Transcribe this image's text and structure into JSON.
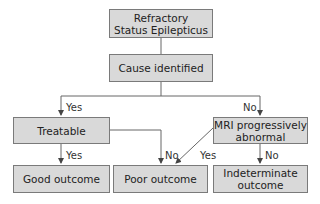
{
  "nodes": {
    "rse": "Refractory\nStatus Epilepticus",
    "cause": "Cause identified",
    "treatable": "Treatable",
    "mri": "MRI progressively\nabnormal",
    "good": "Good outcome",
    "poor": "Poor outcome",
    "indeterminate": "Indeterminate\noutcome"
  },
  "edges": {
    "cause_yes": "Yes",
    "cause_no": "No",
    "treatable_yes": "Yes",
    "treatable_no": "No",
    "mri_yes": "Yes",
    "mri_no": "No"
  },
  "colors": {
    "box_fill": "#d9d9d9",
    "box_border": "#7a7a7a",
    "line": "#555555"
  }
}
